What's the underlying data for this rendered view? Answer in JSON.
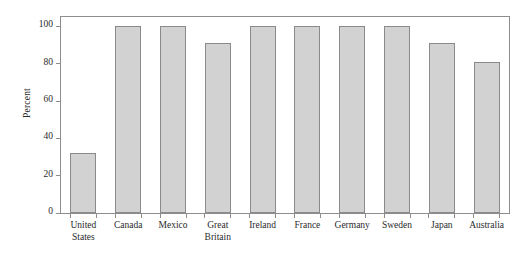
{
  "chart_data": {
    "type": "bar",
    "title": "",
    "subtitle": "",
    "xlabel": "",
    "ylabel": "Percent",
    "ylim": [
      0,
      105
    ],
    "yticks": [
      0,
      20,
      40,
      60,
      80,
      100
    ],
    "ytick_labels": [
      "0",
      "20",
      "40",
      "60",
      "80",
      "100"
    ],
    "grid": false,
    "legend": null,
    "categories": [
      "United States",
      "Canada",
      "Mexico",
      "Great Britain",
      "Ireland",
      "France",
      "Germany",
      "Sweden",
      "Japan",
      "Australia"
    ],
    "category_lines": [
      [
        "United",
        "States"
      ],
      [
        "Canada"
      ],
      [
        "Mexico"
      ],
      [
        "Great",
        "Britain"
      ],
      [
        "Ireland"
      ],
      [
        "France"
      ],
      [
        "Germany"
      ],
      [
        "Sweden"
      ],
      [
        "Japan"
      ],
      [
        "Australia"
      ]
    ],
    "values": [
      32,
      100,
      100,
      91,
      100,
      100,
      100,
      100,
      91,
      81
    ],
    "bar_fill": "#d2d2d2",
    "bar_border": "#8a8a8a",
    "axis_color": "#8d8d8d",
    "background": "#ffffff"
  }
}
